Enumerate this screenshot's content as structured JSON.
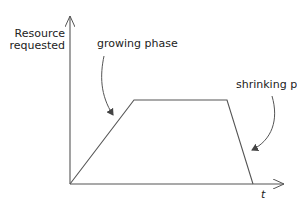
{
  "diagram": {
    "type": "resource-vs-time phase diagram",
    "y_axis_label_line1": "Resource",
    "y_axis_label_line2": "requested",
    "x_axis_label": "t",
    "annotations": {
      "growing": "growing phase",
      "shrinking": "shrinking phase"
    },
    "curve_points": [
      [
        70,
        184
      ],
      [
        134,
        100
      ],
      [
        227,
        100
      ],
      [
        253,
        184
      ]
    ],
    "colors": {
      "line": "#555555",
      "text": "#222222",
      "background": "#ffffff"
    }
  }
}
